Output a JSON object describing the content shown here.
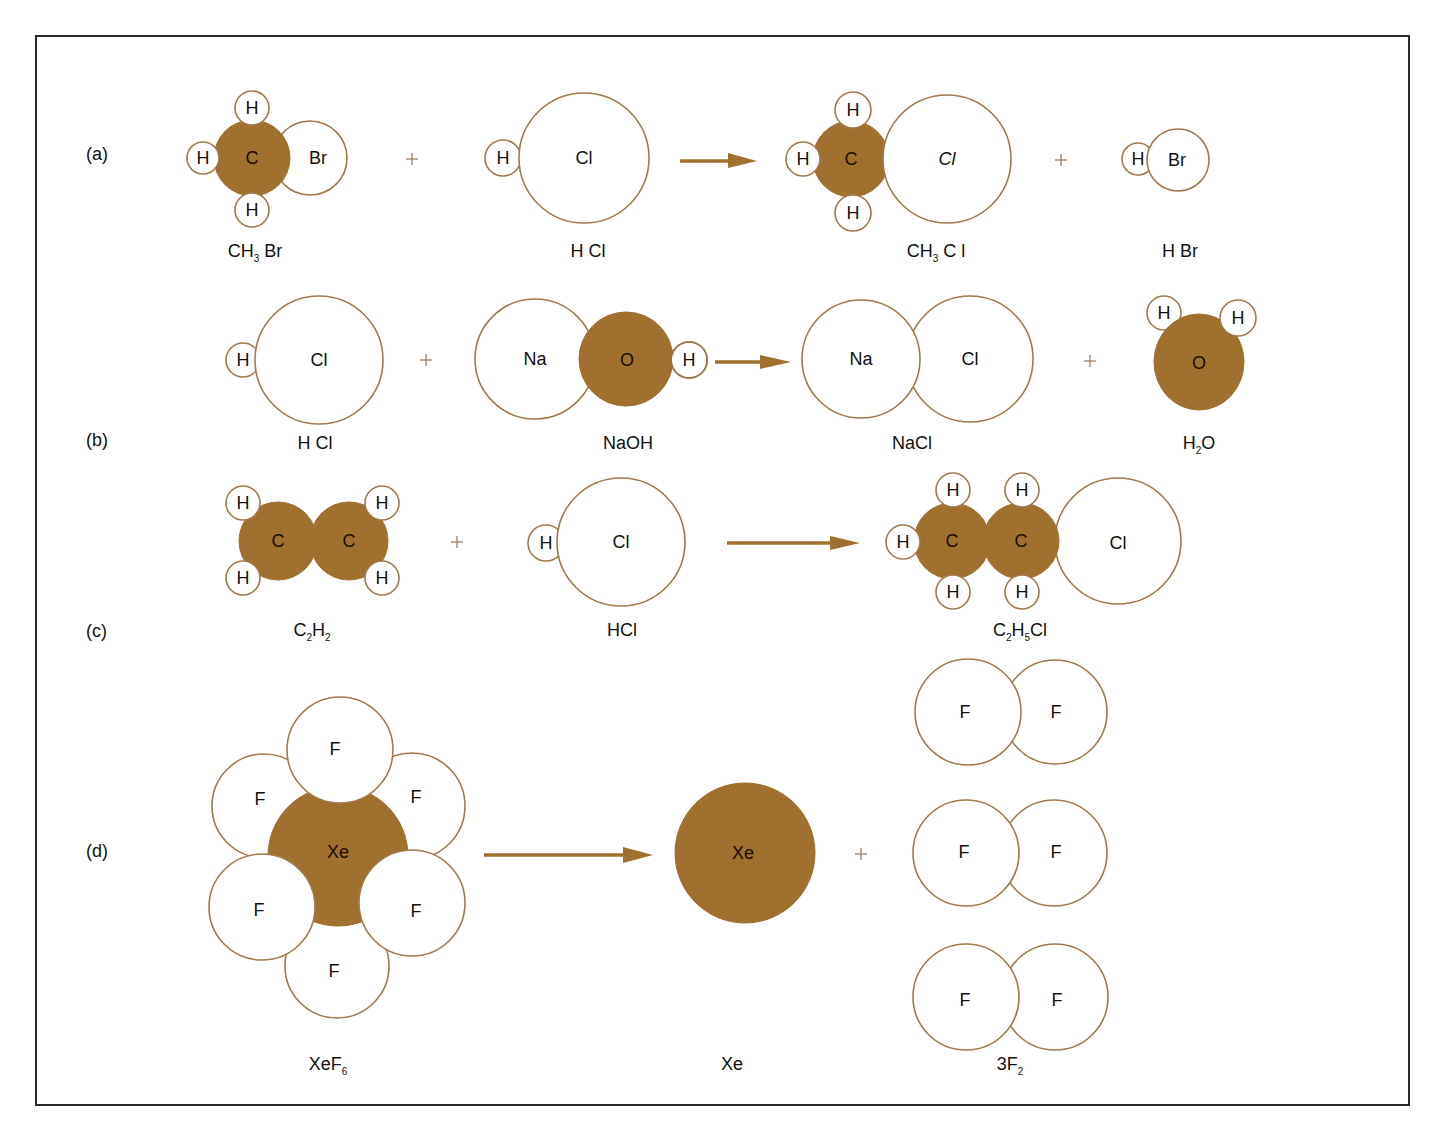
{
  "figure": {
    "colors": {
      "dark_atom_fill": "#a0702f",
      "light_atom_stroke": "#a07a4c",
      "arrow": "#a0702f",
      "frame": "#2a2a2a"
    },
    "parts": [
      {
        "label": "(a)",
        "reactants": [
          {
            "formula": "CH3 Br",
            "atoms": [
              "C",
              "H",
              "H",
              "H",
              "Br"
            ]
          },
          {
            "formula": "H Cl",
            "atoms": [
              "H",
              "Cl"
            ]
          }
        ],
        "products": [
          {
            "formula": "CH3 Cl",
            "atoms": [
              "C",
              "H",
              "H",
              "H",
              "Cl"
            ]
          },
          {
            "formula": "H Br",
            "atoms": [
              "H",
              "Br"
            ]
          }
        ]
      },
      {
        "label": "(b)",
        "reactants": [
          {
            "formula": "H Cl",
            "atoms": [
              "H",
              "Cl"
            ]
          },
          {
            "formula": "NaOH",
            "atoms": [
              "Na",
              "O",
              "H"
            ]
          }
        ],
        "products": [
          {
            "formula": "NaCl",
            "atoms": [
              "Na",
              "Cl"
            ]
          },
          {
            "formula": "H2O",
            "atoms": [
              "O",
              "H",
              "H"
            ]
          }
        ]
      },
      {
        "label": "(c)",
        "reactants": [
          {
            "formula": "C2H2",
            "atoms": [
              "C",
              "C",
              "H",
              "H",
              "H",
              "H"
            ]
          },
          {
            "formula": "HCl",
            "atoms": [
              "H",
              "Cl"
            ]
          }
        ],
        "products": [
          {
            "formula": "C2H5Cl",
            "atoms": [
              "C",
              "C",
              "H",
              "H",
              "H",
              "H",
              "H",
              "Cl"
            ]
          }
        ]
      },
      {
        "label": "(d)",
        "reactants": [
          {
            "formula": "XeF6",
            "atoms": [
              "Xe",
              "F",
              "F",
              "F",
              "F",
              "F",
              "F"
            ]
          }
        ],
        "products": [
          {
            "formula": "Xe",
            "atoms": [
              "Xe"
            ]
          },
          {
            "formula": "3F2",
            "atoms": [
              "F",
              "F",
              "F",
              "F",
              "F",
              "F"
            ]
          }
        ]
      }
    ],
    "symbols": {
      "H": "H",
      "C": "C",
      "Br": "Br",
      "Cl": "Cl",
      "Cl_italic": "Cl",
      "Na": "Na",
      "O": "O",
      "Xe": "Xe",
      "F": "F",
      "plus": "+"
    },
    "formula_parts": {
      "ch3br": {
        "a": "CH",
        "sub": "3",
        "b": " Br"
      },
      "hcl_spaced": "H Cl",
      "ch3cl": {
        "a": "CH",
        "sub": "3",
        "b": " C l"
      },
      "hbr": "H Br",
      "naoh": "NaOH",
      "nacl": "NaCl",
      "h2o": {
        "a": "H",
        "sub": "2",
        "b": "O"
      },
      "c2h2": {
        "a": "C",
        "sub1": "2",
        "b": "H",
        "sub2": "2"
      },
      "hcl": "HCl",
      "c2h5cl": {
        "a": "C",
        "sub1": "2",
        "b": "H",
        "sub2": "5",
        "c": "Cl"
      },
      "xef6": {
        "a": "XeF",
        "sub": "6"
      },
      "xe": "Xe",
      "f2x3": {
        "a": "3F",
        "sub": "2"
      }
    }
  }
}
